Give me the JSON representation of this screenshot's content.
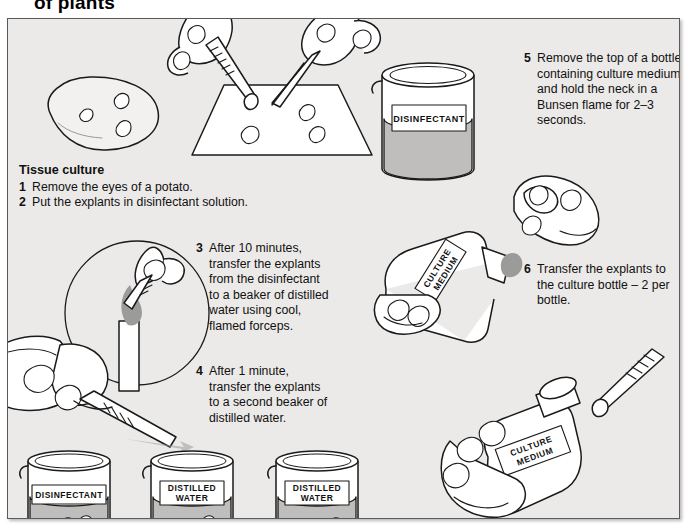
{
  "page": {
    "title": "of plants",
    "background_color": "#eceae8",
    "border_color": "#5a5a5a"
  },
  "tissue_culture": {
    "heading": "Tissue culture",
    "steps": [
      {
        "num": "1",
        "text": "Remove the eyes of a potato."
      },
      {
        "num": "2",
        "text": "Put the explants in disinfectant solution."
      }
    ]
  },
  "steps": [
    {
      "num": "3",
      "text": "After 10 minutes, transfer the explants from the disinfectant to a beaker of distilled water using cool, flamed forceps."
    },
    {
      "num": "4",
      "text": "After 1 minute, transfer the explants to a second beaker of distilled water."
    },
    {
      "num": "5",
      "text": "Remove the top of a bottle containing culture medium and hold the neck in a Bunsen flame for 2–3 seconds."
    },
    {
      "num": "6",
      "text": "Transfer the explants to the culture bottle – 2 per bottle."
    }
  ],
  "labels": {
    "disinfectant_beaker_top": "DISINFECTANT",
    "disinfectant_beaker_bottom": "DISINFECTANT",
    "distilled_water_1_line1": "DISTILLED",
    "distilled_water_1_line2": "WATER",
    "distilled_water_2_line1": "DISTILLED",
    "distilled_water_2_line2": "WATER",
    "culture_medium_bottle_mid_line1": "CULTURE",
    "culture_medium_bottle_mid_line2": "MEDIUM",
    "culture_medium_bottle_bottom_line1": "CULTURE",
    "culture_medium_bottle_bottom_line2": "MEDIUM"
  },
  "colors": {
    "liquid": "#bfbebc",
    "flame": "#9b9b99",
    "ink": "#1a1a1a",
    "paper": "#ffffff"
  }
}
